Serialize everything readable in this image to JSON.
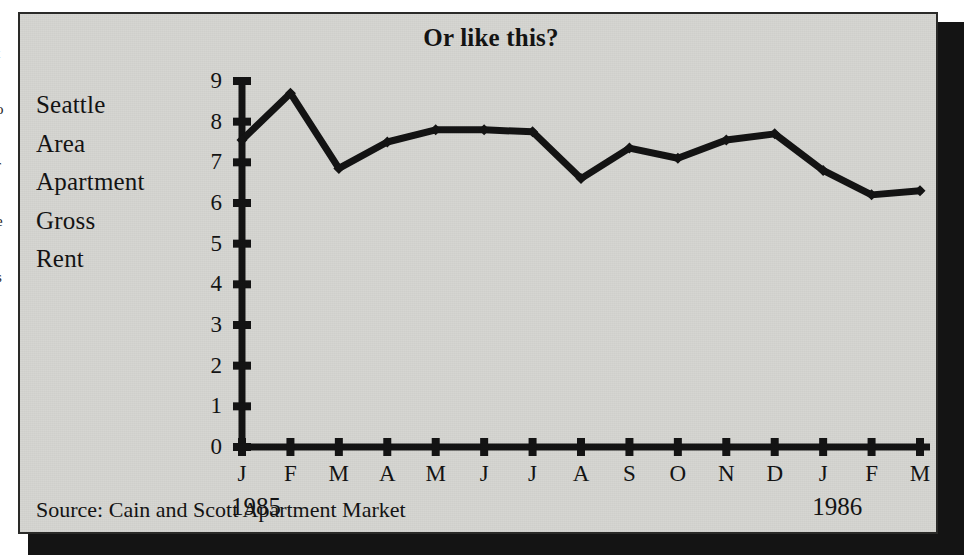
{
  "figure": {
    "title": "Or like this?",
    "side_label_lines": [
      "Seattle",
      "Area",
      "Apartment",
      "Gross",
      "Rent"
    ],
    "source": "Source: Cain and Scott Apartment Market",
    "year_left": "1985",
    "year_right": "1986",
    "paper_color": "#d6d6d2",
    "ink_color": "#141414"
  },
  "left_margin_bleed": [
    "t",
    "o",
    "r",
    "e",
    "s"
  ],
  "chart_data": {
    "type": "line",
    "title": "Or like this?",
    "subtitle": "",
    "xlabel": "",
    "ylabel": "Seattle Area Apartment Gross Rent",
    "source": "Source: Cain and Scott Apartment Market",
    "categories": [
      "J",
      "F",
      "M",
      "A",
      "M",
      "J",
      "J",
      "A",
      "S",
      "O",
      "N",
      "D",
      "J",
      "F",
      "M"
    ],
    "x_period_labels": [
      "1985",
      "1986"
    ],
    "values": [
      7.55,
      8.7,
      6.85,
      7.5,
      7.8,
      7.8,
      7.75,
      6.6,
      7.35,
      7.1,
      7.55,
      7.7,
      6.8,
      6.2,
      6.3
    ],
    "ylim": [
      0,
      9
    ],
    "yticks": [
      0,
      1,
      2,
      3,
      4,
      5,
      6,
      7,
      8,
      9
    ],
    "ytick_labels": [
      "0",
      "1",
      "2",
      "3",
      "4",
      "5",
      "6",
      "7",
      "8",
      "9"
    ],
    "grid": false,
    "legend": false,
    "series": [
      {
        "name": "Seattle Area Apartment Gross Rent",
        "values": [
          7.55,
          8.7,
          6.85,
          7.5,
          7.8,
          7.8,
          7.75,
          6.6,
          7.35,
          7.1,
          7.55,
          7.7,
          6.8,
          6.2,
          6.3
        ],
        "color": "#141414",
        "marker": "diamond",
        "linewidth": 7
      }
    ]
  }
}
